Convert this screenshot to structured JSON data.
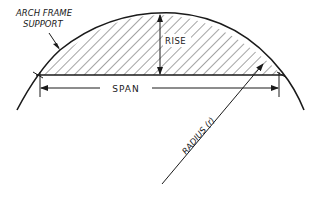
{
  "diagram": {
    "title_label_line1": "ARCH FRAME",
    "title_label_line2": "SUPPORT",
    "rise_label": "RISE",
    "span_label": "SPAN",
    "radius_label": "RADIUS (r)",
    "colors": {
      "ink": "#1a1a1a",
      "background": "#ffffff"
    }
  }
}
